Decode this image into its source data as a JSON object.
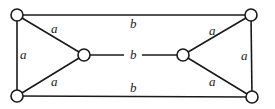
{
  "diagram": {
    "type": "graph",
    "nodes": [
      {
        "id": "top-left",
        "x": 17,
        "y": 15
      },
      {
        "id": "bottom-left",
        "x": 17,
        "y": 96
      },
      {
        "id": "left-middle",
        "x": 84,
        "y": 55
      },
      {
        "id": "right-middle",
        "x": 183,
        "y": 55
      },
      {
        "id": "top-right",
        "x": 251,
        "y": 15
      },
      {
        "id": "bottom-right",
        "x": 252,
        "y": 97
      }
    ],
    "edges": [
      {
        "from": "top-left",
        "to": "top-right",
        "label": "b"
      },
      {
        "from": "bottom-left",
        "to": "bottom-right",
        "label": "b"
      },
      {
        "from": "left-middle",
        "to": "right-middle",
        "label": "b"
      },
      {
        "from": "top-left",
        "to": "bottom-left",
        "label": "a"
      },
      {
        "from": "top-left",
        "to": "left-middle",
        "label": "a"
      },
      {
        "from": "bottom-left",
        "to": "left-middle",
        "label": "a"
      },
      {
        "from": "top-right",
        "to": "bottom-right",
        "label": "a"
      },
      {
        "from": "top-right",
        "to": "right-middle",
        "label": "a"
      },
      {
        "from": "bottom-right",
        "to": "right-middle",
        "label": "a"
      }
    ],
    "labels": {
      "top_b": "b",
      "bottom_b": "b",
      "middle_b": "b",
      "left_vertical_a": "a",
      "left_upper_a": "a",
      "left_lower_a": "a",
      "right_vertical_a": "a",
      "right_upper_a": "a",
      "right_lower_a": "a"
    }
  }
}
